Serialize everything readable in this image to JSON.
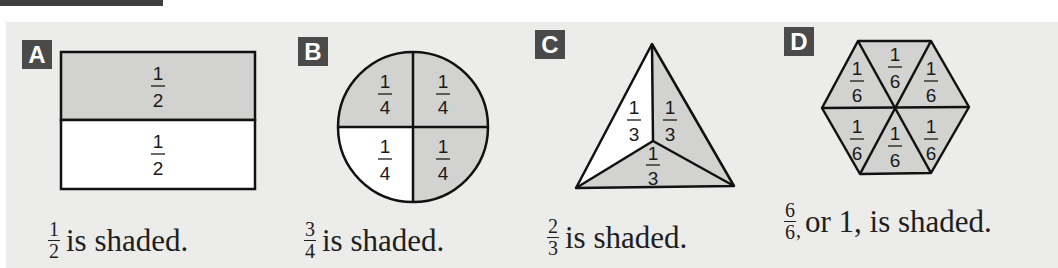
{
  "colors": {
    "shaded": "#d2d2d0",
    "unshaded": "#ffffff",
    "outline": "#111111",
    "badge": "#4a4a4a",
    "panel": "#ececea"
  },
  "figures": [
    {
      "id": "A",
      "shape": "rectangle",
      "parts": [
        {
          "position": "top",
          "num": "1",
          "den": "2",
          "shaded": true
        },
        {
          "position": "bottom",
          "num": "1",
          "den": "2",
          "shaded": false
        }
      ],
      "caption": {
        "num": "1",
        "den": "2",
        "comma": "",
        "text": "is shaded."
      }
    },
    {
      "id": "B",
      "shape": "circle",
      "parts": [
        {
          "position": "top-left",
          "num": "1",
          "den": "4",
          "shaded": true
        },
        {
          "position": "top-right",
          "num": "1",
          "den": "4",
          "shaded": true
        },
        {
          "position": "bottom-left",
          "num": "1",
          "den": "4",
          "shaded": false
        },
        {
          "position": "bottom-right",
          "num": "1",
          "den": "4",
          "shaded": true
        }
      ],
      "caption": {
        "num": "3",
        "den": "4",
        "comma": "",
        "text": "is shaded."
      }
    },
    {
      "id": "C",
      "shape": "triangle",
      "parts": [
        {
          "position": "left",
          "num": "1",
          "den": "3",
          "shaded": false
        },
        {
          "position": "right",
          "num": "1",
          "den": "3",
          "shaded": true
        },
        {
          "position": "bottom",
          "num": "1",
          "den": "3",
          "shaded": true
        }
      ],
      "caption": {
        "num": "2",
        "den": "3",
        "comma": "",
        "text": "is shaded."
      }
    },
    {
      "id": "D",
      "shape": "hexagon",
      "parts": [
        {
          "position": "upper-left",
          "num": "1",
          "den": "6",
          "shaded": true
        },
        {
          "position": "top",
          "num": "1",
          "den": "6",
          "shaded": true
        },
        {
          "position": "upper-right",
          "num": "1",
          "den": "6",
          "shaded": true
        },
        {
          "position": "lower-left",
          "num": "1",
          "den": "6",
          "shaded": true
        },
        {
          "position": "bottom",
          "num": "1",
          "den": "6",
          "shaded": true
        },
        {
          "position": "lower-right",
          "num": "1",
          "den": "6",
          "shaded": true
        }
      ],
      "caption": {
        "num": "6",
        "den": "6",
        "comma": ",",
        "text": "or 1, is shaded."
      }
    }
  ]
}
